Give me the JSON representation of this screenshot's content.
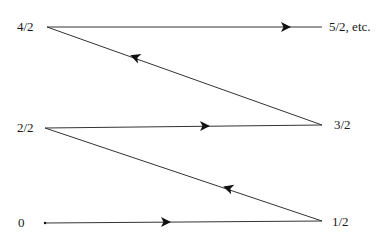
{
  "diagram": {
    "type": "zigzag-enumeration",
    "colors": {
      "line": "#333333",
      "arrow": "#111111",
      "text": "#1a1a1a",
      "background": "#ffffff"
    },
    "nodes": [
      {
        "id": "n0",
        "label": "0",
        "x": 45,
        "y": 223,
        "label_x": 17,
        "label_y": 216
      },
      {
        "id": "n1",
        "label": "1/2",
        "x": 322,
        "y": 221,
        "label_x": 332,
        "label_y": 215
      },
      {
        "id": "n2",
        "label": "2/2",
        "x": 45,
        "y": 128,
        "label_x": 17,
        "label_y": 121
      },
      {
        "id": "n3",
        "label": "3/2",
        "x": 322,
        "y": 125,
        "label_x": 334,
        "label_y": 118
      },
      {
        "id": "n4",
        "label": "4/2",
        "x": 47,
        "y": 27,
        "label_x": 17,
        "label_y": 20
      },
      {
        "id": "n5",
        "label": "5/2, etc.",
        "x": 322,
        "y": 27,
        "label_x": 329,
        "label_y": 20
      }
    ],
    "edges": [
      {
        "from": "n0",
        "to": "n1",
        "arrow_x": 166,
        "arrow_y": 222
      },
      {
        "from": "n1",
        "to": "n2",
        "arrow_x": 228,
        "arrow_y": 188
      },
      {
        "from": "n2",
        "to": "n3",
        "arrow_x": 205,
        "arrow_y": 126
      },
      {
        "from": "n3",
        "to": "n4",
        "arrow_x": 135,
        "arrow_y": 57
      },
      {
        "from": "n4",
        "to": "n5",
        "arrow_x": 286,
        "arrow_y": 27
      }
    ]
  },
  "labels": {
    "zero": "0",
    "one_half": "1/2",
    "two_halves": "2/2",
    "three_halves": "3/2",
    "four_halves": "4/2",
    "five_halves": "5/2, etc."
  }
}
